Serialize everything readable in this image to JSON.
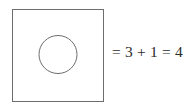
{
  "figure": {
    "kind": "geometric-set-diagram",
    "background_color": "#ffffff",
    "stroke_color": "#6d6d6d",
    "text_color": "#2b2b2b"
  },
  "shapes": {
    "square": {
      "label": "square-outline",
      "x": 12,
      "y": 9,
      "width": 91,
      "height": 92,
      "stroke": "#6d6d6d",
      "stroke_width": 1,
      "fill": "none"
    },
    "circle": {
      "label": "circle-outline",
      "cx": 58,
      "cy": 54.5,
      "r": 19,
      "stroke": "#6d6d6d",
      "stroke_width": 1,
      "fill": "none"
    }
  },
  "equation": {
    "full": "= 3 + 1 = 4",
    "equals_first": "=",
    "term_one": "3",
    "plus": "+",
    "term_two": "1",
    "equals_second": "=",
    "result": "4"
  }
}
